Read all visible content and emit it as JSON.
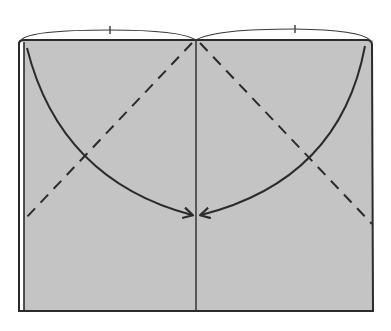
{
  "diagram": {
    "type": "origami-fold-instruction",
    "colors": {
      "paper_fill": "#c4c4c4",
      "stroke": "#2b2b2b",
      "background": "#ffffff"
    },
    "elements": {
      "paper": {
        "x": 18,
        "y": 40,
        "width": 355,
        "height": 271
      },
      "center_crease": {
        "x": 196
      },
      "measure_arcs": [
        {
          "from": [
            20,
            40
          ],
          "to": [
            196,
            40
          ],
          "tick_x": 110,
          "label": "equal-half"
        },
        {
          "from": [
            196,
            40
          ],
          "to": [
            370,
            40
          ],
          "tick_x": 295,
          "label": "equal-half"
        }
      ],
      "valley_fold_lines": [
        {
          "from": [
            192,
            42
          ],
          "to": [
            25,
            219
          ],
          "style": "dashed"
        },
        {
          "from": [
            200,
            42
          ],
          "to": [
            370,
            223
          ],
          "style": "dashed"
        }
      ],
      "fold_arrows": [
        {
          "from": [
            27,
            48
          ],
          "to": [
            193,
            215
          ],
          "direction": "left-corner-to-center"
        },
        {
          "from": [
            366,
            46
          ],
          "to": [
            201,
            215
          ],
          "direction": "right-corner-to-center"
        }
      ]
    }
  }
}
